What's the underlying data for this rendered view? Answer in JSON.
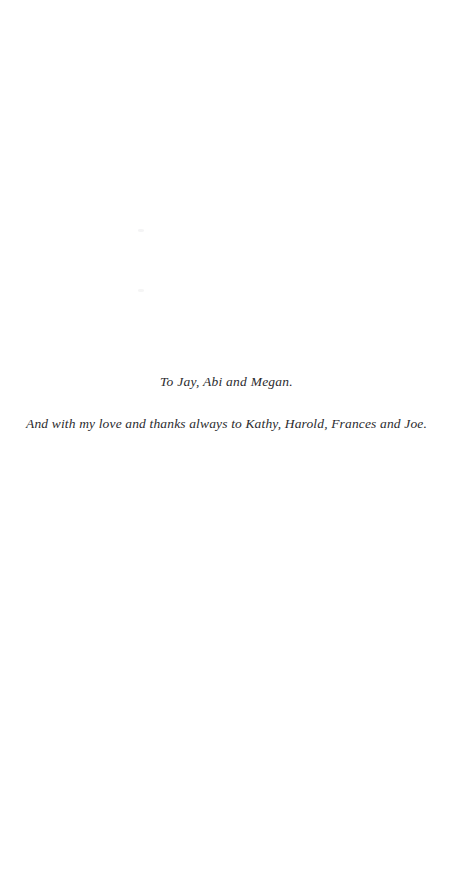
{
  "page": {
    "kind": "book-dedication-page",
    "background_color": "#ffffff",
    "text_color": "#2b2b2e",
    "width_px": 453,
    "height_px": 884
  },
  "dedication": {
    "line_primary": "To Jay, Abi and Megan.",
    "line_secondary": "And with my love and thanks always to Kathy, Harold, Frances and Joe."
  },
  "artifacts": {
    "speck_upper_label": "",
    "speck_lower_label": ""
  }
}
